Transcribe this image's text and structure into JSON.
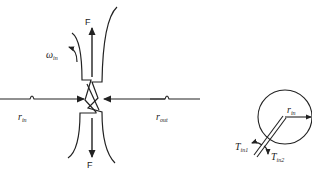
{
  "diagram": {
    "left_figure": {
      "force_top_label": "F",
      "force_bottom_label": "F",
      "angular_velocity_label": "ω",
      "angular_velocity_sub": "in",
      "r_in_label": "r",
      "r_in_sub": "in",
      "r_out_label": "r",
      "r_out_sub": "out"
    },
    "right_figure": {
      "radius_label": "r",
      "radius_sub": "in",
      "torque1_label": "T",
      "torque1_sub": "in1",
      "torque2_label": "T",
      "torque2_sub": "in2"
    },
    "colors": {
      "stroke": "#222222",
      "background": "#ffffff"
    }
  }
}
